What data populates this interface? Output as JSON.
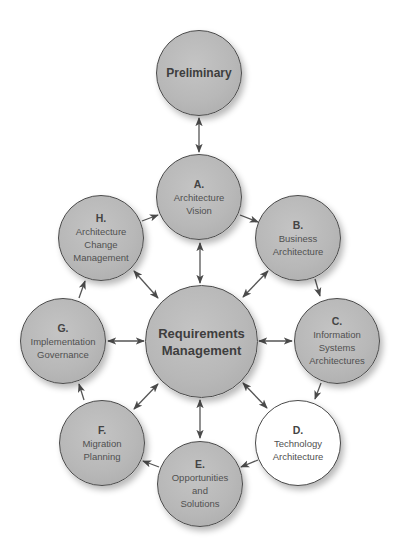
{
  "diagram": {
    "title": "",
    "colors": {
      "node_fill": "#b8b8b8",
      "highlight_fill": "#ffffff",
      "stroke": "#4a4a4a",
      "text": "#4a4a4a"
    },
    "nodes": {
      "preliminary": {
        "letter": "",
        "label": "Preliminary",
        "fill": "grey"
      },
      "a": {
        "letter": "A.",
        "label": "Architecture\nVision",
        "fill": "grey"
      },
      "b": {
        "letter": "B.",
        "label": "Business\nArchitecture",
        "fill": "grey"
      },
      "c": {
        "letter": "C.",
        "label": "Information\nSystems\nArchitectures",
        "fill": "grey"
      },
      "d": {
        "letter": "D.",
        "label": "Technology\nArchitecture",
        "fill": "white"
      },
      "e": {
        "letter": "E.",
        "label": "Opportunities\nand\nSolutions",
        "fill": "grey"
      },
      "f": {
        "letter": "F.",
        "label": "Migration\nPlanning",
        "fill": "grey"
      },
      "g": {
        "letter": "G.",
        "label": "Implementation\nGovernance",
        "fill": "grey"
      },
      "h": {
        "letter": "H.",
        "label": "Architecture\nChange\nManagement",
        "fill": "grey"
      },
      "requirements": {
        "letter": "",
        "label": "Requirements\nManagement",
        "fill": "grey"
      }
    },
    "edges": [
      {
        "from": "Preliminary",
        "to": "A. Architecture Vision",
        "type": "bidirectional"
      },
      {
        "from": "A. Architecture Vision",
        "to": "B. Business Architecture",
        "type": "directed"
      },
      {
        "from": "B. Business Architecture",
        "to": "C. Information Systems Architectures",
        "type": "directed"
      },
      {
        "from": "C. Information Systems Architectures",
        "to": "D. Technology Architecture",
        "type": "directed"
      },
      {
        "from": "D. Technology Architecture",
        "to": "E. Opportunities and Solutions",
        "type": "directed"
      },
      {
        "from": "E. Opportunities and Solutions",
        "to": "F. Migration Planning",
        "type": "directed"
      },
      {
        "from": "F. Migration Planning",
        "to": "G. Implementation Governance",
        "type": "directed"
      },
      {
        "from": "G. Implementation Governance",
        "to": "H. Architecture Change Management",
        "type": "directed"
      },
      {
        "from": "H. Architecture Change Management",
        "to": "A. Architecture Vision",
        "type": "directed"
      },
      {
        "from": "Requirements Management",
        "to": "A. Architecture Vision",
        "type": "bidirectional"
      },
      {
        "from": "Requirements Management",
        "to": "B. Business Architecture",
        "type": "bidirectional"
      },
      {
        "from": "Requirements Management",
        "to": "C. Information Systems Architectures",
        "type": "bidirectional"
      },
      {
        "from": "Requirements Management",
        "to": "D. Technology Architecture",
        "type": "bidirectional"
      },
      {
        "from": "Requirements Management",
        "to": "E. Opportunities and Solutions",
        "type": "bidirectional"
      },
      {
        "from": "Requirements Management",
        "to": "F. Migration Planning",
        "type": "bidirectional"
      },
      {
        "from": "Requirements Management",
        "to": "G. Implementation Governance",
        "type": "bidirectional"
      },
      {
        "from": "Requirements Management",
        "to": "H. Architecture Change Management",
        "type": "bidirectional"
      }
    ]
  }
}
